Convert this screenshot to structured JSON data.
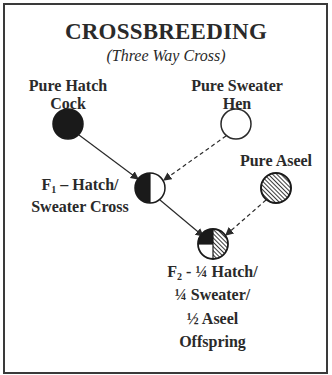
{
  "title": "CROSSBREEDING",
  "subtitle": "(Three Way Cross)",
  "nodes": {
    "hatch_cock": {
      "line1": "Pure Hatch",
      "line2": "Cock",
      "fill": "#1a1a1a"
    },
    "sweater_hen": {
      "line1": "Pure Sweater",
      "line2": "Hen",
      "fill": "#ffffff"
    },
    "aseel": {
      "line1": "Pure Aseel",
      "fill": "hatched"
    },
    "f1": {
      "prefix": "F",
      "sub": "1",
      "line1_rest": " – Hatch/",
      "line2": "Sweater Cross",
      "fill": "half black / half white"
    },
    "f2": {
      "prefix": "F",
      "sub": "2",
      "line1_rest": " - ¼ Hatch/",
      "line2": "¼ Sweater/",
      "line3": "½ Aseel",
      "line4": "Offspring",
      "fill": "quarter black / quarter white / half hatched"
    }
  },
  "edges": [
    {
      "from": "Pure Hatch Cock",
      "to": "F1",
      "style": "solid"
    },
    {
      "from": "Pure Sweater Hen",
      "to": "F1",
      "style": "dashed"
    },
    {
      "from": "F1",
      "to": "F2",
      "style": "solid"
    },
    {
      "from": "Pure Aseel",
      "to": "F2",
      "style": "dashed"
    }
  ],
  "colors": {
    "ink": "#2a2a2a",
    "border": "#3a3a3a",
    "background": "#ffffff"
  }
}
